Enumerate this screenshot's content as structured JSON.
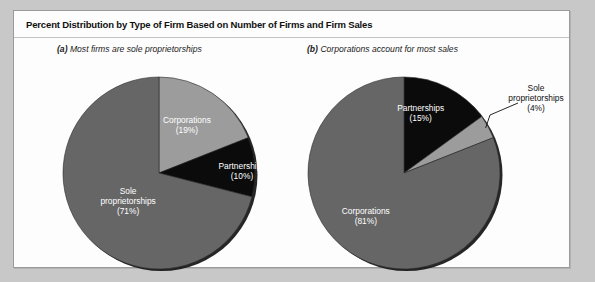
{
  "figure": {
    "title": "Percent Distribution by Type of Firm Based on Number of Firms and Firm Sales"
  },
  "panels": [
    {
      "id": "a",
      "tag": "(a)",
      "caption": "Most firms are sole proprietorships",
      "caption_full": "(a) Most firms are sole proprietorships"
    },
    {
      "id": "b",
      "tag": "(b)",
      "caption": "Corporations account for most sales",
      "caption_full": "(b) Corporations account for most sales"
    }
  ],
  "colors": {
    "light_gray": "#9c9c9c",
    "mid_gray": "#666666",
    "black": "#0b0b0b",
    "card_bg": "#fdfdfd",
    "page_bg": "#c8c8c8",
    "border": "#9a9a9a",
    "label_light": "#ffffff",
    "label_dark": "#111111"
  },
  "chart_data": [
    {
      "type": "pie",
      "panel": "a",
      "title": "(a) Most firms are sole proprietorships",
      "categories": [
        "Corporations",
        "Partnerships",
        "Sole proprietorships"
      ],
      "values": [
        19,
        10,
        71
      ],
      "unit": "%",
      "start_angle": 0,
      "direction": "clockwise",
      "legend": "none",
      "labels": [
        {
          "name": "Corporations",
          "value": 19,
          "text": "Corporations",
          "pct_text": "(19%)",
          "placement": "inside",
          "fill": "#9c9c9c",
          "text_color": "#ffffff"
        },
        {
          "name": "Partnerships",
          "value": 10,
          "text": "Partnerships",
          "pct_text": "(10%)",
          "placement": "inside",
          "fill": "#0b0b0b",
          "text_color": "#ffffff"
        },
        {
          "name": "Sole proprietorships",
          "value": 71,
          "text_line1": "Sole",
          "text_line2": "proprietorships",
          "pct_text": "(71%)",
          "placement": "inside",
          "fill": "#666666",
          "text_color": "#ffffff"
        }
      ]
    },
    {
      "type": "pie",
      "panel": "b",
      "title": "(b) Corporations account for most sales",
      "categories": [
        "Partnerships",
        "Sole proprietorships",
        "Corporations"
      ],
      "values": [
        15,
        4,
        81
      ],
      "unit": "%",
      "start_angle": 0,
      "direction": "clockwise",
      "legend": "none",
      "labels": [
        {
          "name": "Partnerships",
          "value": 15,
          "text": "Partnerships",
          "pct_text": "(15%)",
          "placement": "inside",
          "fill": "#0b0b0b",
          "text_color": "#ffffff"
        },
        {
          "name": "Sole proprietorships",
          "value": 4,
          "text_line1": "Sole",
          "text_line2": "proprietorships",
          "pct_text": "(4%)",
          "placement": "outside",
          "fill": "#9c9c9c",
          "text_color": "#111111",
          "leader_line": true
        },
        {
          "name": "Corporations",
          "value": 81,
          "text": "Corporations",
          "pct_text": "(81%)",
          "placement": "inside",
          "fill": "#666666",
          "text_color": "#ffffff"
        }
      ]
    }
  ]
}
